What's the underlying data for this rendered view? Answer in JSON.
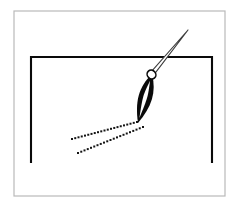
{
  "figure": {
    "title": "Stylus drawing a dotted line inside an open rectangle",
    "caption": "",
    "width": 243,
    "height": 212,
    "background_color": "#ffffff"
  },
  "colors": {
    "background": "#ffffff",
    "outer_border": "#b9b9b9",
    "ink_black": "#0a0a0a",
    "shaft_outline": "#3c3c3c",
    "shaft_fill": "#ffffff",
    "dot_color": "#141414",
    "highlight_gray": "#9a9a9a"
  },
  "outer_frame": {
    "name": "outer-border-rectangle",
    "x": 14,
    "y": 11,
    "width": 211,
    "height": 185,
    "stroke_width": 1.2,
    "stroke": "#b9b9b9",
    "fill": "none"
  },
  "inner_shape": {
    "name": "open-bottom-rectangle",
    "description": "Three-sided rectangle: left vertical, top horizontal, right vertical; bottom edge absent",
    "left_x": 31,
    "right_x": 212,
    "top_y": 57,
    "bottom_y": 163,
    "stroke_width": 2.1,
    "stroke": "#0a0a0a"
  },
  "stylus": {
    "name": "pen-stylus",
    "shaft": {
      "name": "needle-shaft",
      "tip_x": 188,
      "tip_y": 30,
      "base_x": 152,
      "base_y": 73,
      "stroke": "#3c3c3c",
      "fill": "#ffffff",
      "stroke_width": 1.1,
      "half_width": 2.6
    },
    "collar": {
      "name": "shaft-collar-ring",
      "cx": 151.5,
      "cy": 74.5,
      "rx": 4.2,
      "ry": 4.6,
      "rotation": -42,
      "fill": "#ffffff",
      "stroke": "#0a0a0a",
      "stroke_width": 1.6
    },
    "body": {
      "name": "black-tapered-body",
      "top_x": 152,
      "top_y": 74,
      "tip_x": 138,
      "tip_y": 123,
      "max_half_width": 9.5,
      "fill": "#0a0a0a"
    },
    "inner_gap": {
      "name": "body-inner-white-slit",
      "fill": "#ffffff",
      "description": "Narrow white lens-shaped gap running lengthwise through the black body"
    }
  },
  "dotted_trails": [
    {
      "name": "upper-dotted-trail",
      "start_x": 137,
      "start_y": 122,
      "end_x": 72,
      "end_y": 139,
      "dot_count": 21,
      "dot_size": 2.0,
      "color": "#141414"
    },
    {
      "name": "lower-dotted-trail",
      "start_x": 143,
      "start_y": 127,
      "end_x": 78,
      "end_y": 153,
      "dot_count": 21,
      "dot_size": 2.0,
      "color": "#141414"
    }
  ],
  "labels": {
    "none_visible": "This figure contains no rendered text"
  }
}
